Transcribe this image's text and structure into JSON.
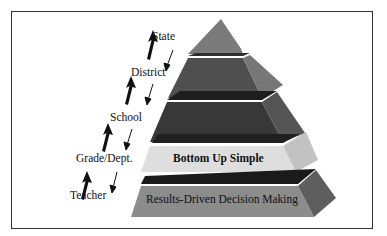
{
  "diagram": {
    "levels_ladder": [
      {
        "label": "State"
      },
      {
        "label": "District"
      },
      {
        "label": "School"
      },
      {
        "label": "Grade/Dept."
      },
      {
        "label": "Teacher"
      }
    ],
    "arrows": {
      "up": "bold-up-arrow",
      "down": "thin-down-arrow"
    },
    "pyramid_layers": [
      {
        "label": "",
        "color": "#6a6a6a"
      },
      {
        "label": "",
        "color": "#4a4a4a"
      },
      {
        "label": "",
        "color": "#3a3a3a"
      },
      {
        "label": "Bottom Up Simple",
        "color": "#dcdcdc"
      },
      {
        "label": "Results-Driven Decision Making",
        "color": "#8a8a8a"
      }
    ]
  }
}
